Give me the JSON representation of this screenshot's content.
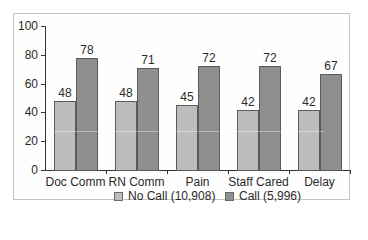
{
  "chart_data": {
    "type": "bar",
    "title": "",
    "xlabel": "",
    "ylabel": "",
    "ylim": [
      0,
      100
    ],
    "yticks": [
      0,
      20,
      40,
      60,
      80,
      100
    ],
    "categories": [
      "Doc Comm",
      "RN Comm",
      "Pain",
      "Staff Cared",
      "Delay"
    ],
    "series": [
      {
        "name": "No Call (10,908)",
        "values": [
          48,
          48,
          45,
          42,
          42
        ],
        "color": "#bdbdbd"
      },
      {
        "name": "Call (5,996)",
        "values": [
          78,
          71,
          72,
          72,
          67
        ],
        "color": "#8f8f8f"
      }
    ],
    "grid": false,
    "legend_position": "bottom"
  },
  "axis": {
    "y_labels": [
      "0",
      "20",
      "40",
      "60",
      "80",
      "100"
    ]
  },
  "labels": {
    "nocall": [
      "48",
      "48",
      "45",
      "42",
      "42"
    ],
    "call": [
      "78",
      "71",
      "72",
      "72",
      "67"
    ]
  },
  "legend": {
    "nocall": "No Call (10,908)",
    "call": "Call (5,996)"
  }
}
